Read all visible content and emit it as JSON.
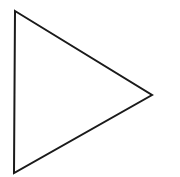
{
  "diagram": {
    "shape": "triangle",
    "orientation": "pointing-right",
    "fill": "#ffffff",
    "stroke": "#1a1a1a",
    "stroke_width": 2,
    "vertices": [
      [
        15,
        11
      ],
      [
        152,
        95
      ],
      [
        14,
        173
      ]
    ]
  }
}
